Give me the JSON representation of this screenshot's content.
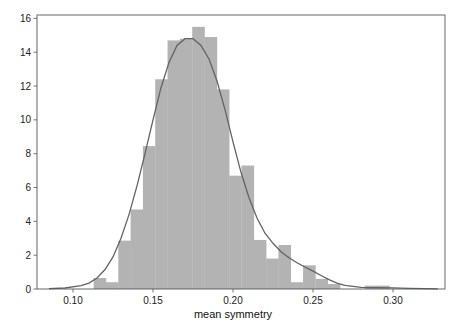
{
  "chart_data": {
    "type": "bar",
    "subtype": "histogram_with_kde",
    "title": "",
    "xlabel": "mean symmetry",
    "ylabel": "",
    "xlim": [
      0.0775,
      0.3325
    ],
    "ylim": [
      0,
      16.2
    ],
    "xticks": [
      0.1,
      0.15,
      0.2,
      0.25,
      0.3
    ],
    "xtick_labels": [
      "0.10",
      "0.15",
      "0.20",
      "0.25",
      "0.30"
    ],
    "yticks": [
      0,
      2,
      4,
      6,
      8,
      10,
      12,
      14,
      16
    ],
    "ytick_labels": [
      "0",
      "2",
      "4",
      "6",
      "8",
      "10",
      "12",
      "14",
      "16"
    ],
    "grid": false,
    "legend": null,
    "bin_width": 0.0077,
    "bins": [
      {
        "x0": 0.1129,
        "height": 0.65
      },
      {
        "x0": 0.1206,
        "height": 0.4
      },
      {
        "x0": 0.1283,
        "height": 2.86
      },
      {
        "x0": 0.136,
        "height": 4.7
      },
      {
        "x0": 0.1437,
        "height": 8.45
      },
      {
        "x0": 0.1514,
        "height": 12.4
      },
      {
        "x0": 0.1591,
        "height": 14.7
      },
      {
        "x0": 0.1668,
        "height": 14.8
      },
      {
        "x0": 0.1745,
        "height": 15.5
      },
      {
        "x0": 0.1822,
        "height": 14.9
      },
      {
        "x0": 0.1899,
        "height": 11.8
      },
      {
        "x0": 0.1976,
        "height": 6.7
      },
      {
        "x0": 0.2053,
        "height": 7.3
      },
      {
        "x0": 0.213,
        "height": 2.9
      },
      {
        "x0": 0.2207,
        "height": 1.8
      },
      {
        "x0": 0.2284,
        "height": 2.6
      },
      {
        "x0": 0.2361,
        "height": 0.4
      },
      {
        "x0": 0.2438,
        "height": 1.4
      },
      {
        "x0": 0.2515,
        "height": 0.6
      },
      {
        "x0": 0.2592,
        "height": 0.3
      },
      {
        "x0": 0.2669,
        "height": 0
      },
      {
        "x0": 0.2746,
        "height": 0
      },
      {
        "x0": 0.2823,
        "height": 0.2
      },
      {
        "x0": 0.29,
        "height": 0.2
      }
    ],
    "kde": {
      "x": [
        0.085,
        0.095,
        0.105,
        0.11,
        0.115,
        0.12,
        0.125,
        0.13,
        0.135,
        0.14,
        0.145,
        0.15,
        0.155,
        0.16,
        0.165,
        0.17,
        0.175,
        0.18,
        0.185,
        0.19,
        0.195,
        0.2,
        0.205,
        0.21,
        0.215,
        0.22,
        0.225,
        0.23,
        0.235,
        0.24,
        0.245,
        0.25,
        0.255,
        0.26,
        0.265,
        0.27,
        0.28,
        0.29,
        0.3,
        0.31,
        0.32,
        0.328
      ],
      "y": [
        0.02,
        0.06,
        0.2,
        0.35,
        0.65,
        1.15,
        1.9,
        3.0,
        4.4,
        6.1,
        8.0,
        10.0,
        11.9,
        13.4,
        14.4,
        14.8,
        14.8,
        14.4,
        13.6,
        12.3,
        10.6,
        8.7,
        6.9,
        5.4,
        4.2,
        3.3,
        2.7,
        2.2,
        1.85,
        1.55,
        1.3,
        1.05,
        0.8,
        0.55,
        0.35,
        0.22,
        0.1,
        0.08,
        0.07,
        0.04,
        0.02,
        0.01
      ]
    },
    "colors": {
      "bars": "#b3b3b3",
      "kde_line": "#636363",
      "frame": "#555555",
      "background": "#ffffff"
    }
  },
  "plot_area": {
    "left": 37,
    "top": 15,
    "right": 445,
    "bottom": 289
  }
}
